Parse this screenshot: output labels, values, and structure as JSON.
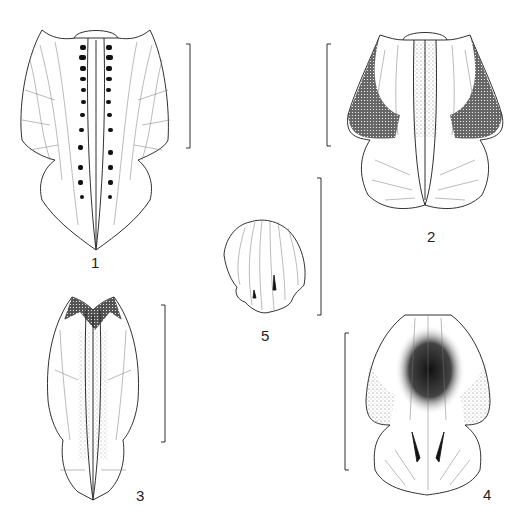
{
  "plate": {
    "type": "botanical line illustration plate",
    "figures": [
      {
        "number": "1",
        "label": "1",
        "description": "lip (labellum) spread, with dark verrucose ridges along median keels",
        "has_scale_bar": true
      },
      {
        "number": "2",
        "label": "2",
        "description": "lip spread, side lobes shaded dark at margins, mid-lobe bilobed",
        "has_scale_bar": true
      },
      {
        "number": "3",
        "label": "3",
        "description": "lip narrow elongate, dark apical shading on side lobes",
        "has_scale_bar": true
      },
      {
        "number": "4",
        "label": "4",
        "description": "lip with heavy central stippling and two dark calli",
        "has_scale_bar": true
      },
      {
        "number": "5",
        "label": "5",
        "description": "small lip with radiating veins and two small calli",
        "has_scale_bar": true
      }
    ],
    "colors": {
      "ink": "#1a1a1a",
      "background": "#ffffff",
      "stipple": "#555555"
    }
  }
}
